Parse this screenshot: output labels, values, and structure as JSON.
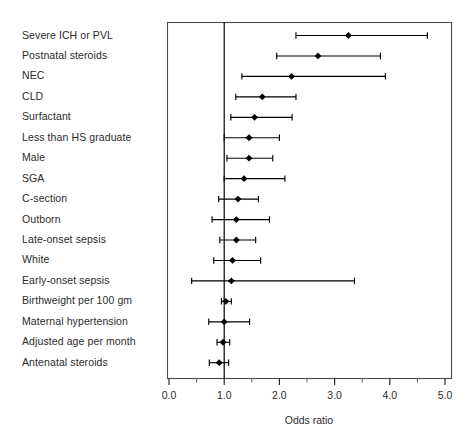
{
  "chart_data": {
    "type": "scatter",
    "plot_style": "forest-plot",
    "title": "",
    "xlabel": "Odds ratio",
    "ylabel": "",
    "xlim": [
      0.0,
      5.0
    ],
    "xticks": [
      0.0,
      1.0,
      2.0,
      3.0,
      4.0,
      5.0
    ],
    "xtick_labels": [
      "0.0",
      "1.0",
      "2.0",
      "3.0",
      "4.0",
      "5.0"
    ],
    "minor_xticks": [
      0.5,
      1.5,
      2.5,
      3.5,
      4.5
    ],
    "grid": false,
    "legend": null,
    "reference_line": 1.0,
    "marker": "filled-diamond",
    "categories": [
      "Severe ICH or PVL",
      "Postnatal steroids",
      "NEC",
      "CLD",
      "Surfactant",
      "Less than HS graduate",
      "Male",
      "SGA",
      "C-section",
      "Outborn",
      "Late-onset sepsis",
      "White",
      "Early-onset sepsis",
      "Birthweight per 100 gm",
      "Maternal hypertension",
      "Adjusted age per month",
      "Antenatal steroids"
    ],
    "values": [
      3.25,
      2.7,
      2.22,
      1.69,
      1.55,
      1.45,
      1.45,
      1.36,
      1.25,
      1.22,
      1.22,
      1.15,
      1.13,
      1.03,
      1.0,
      0.98,
      0.91
    ],
    "ci_low": [
      2.3,
      1.95,
      1.32,
      1.21,
      1.12,
      1.0,
      1.05,
      1.0,
      0.9,
      0.78,
      0.92,
      0.81,
      0.41,
      0.95,
      0.72,
      0.87,
      0.73
    ],
    "ci_high": [
      4.68,
      3.83,
      3.92,
      2.3,
      2.23,
      2.0,
      1.88,
      2.1,
      1.62,
      1.82,
      1.57,
      1.66,
      3.36,
      1.13,
      1.46,
      1.1,
      1.08
    ],
    "series": [
      {
        "name": "Adjusted odds ratio with 95% CI",
        "points": [
          {
            "label": "Severe ICH or PVL",
            "or": 3.25,
            "lo": 2.3,
            "hi": 4.68
          },
          {
            "label": "Postnatal steroids",
            "or": 2.7,
            "lo": 1.95,
            "hi": 3.83
          },
          {
            "label": "NEC",
            "or": 2.22,
            "lo": 1.32,
            "hi": 3.92
          },
          {
            "label": "CLD",
            "or": 1.69,
            "lo": 1.21,
            "hi": 2.3
          },
          {
            "label": "Surfactant",
            "or": 1.55,
            "lo": 1.12,
            "hi": 2.23
          },
          {
            "label": "Less than HS graduate",
            "or": 1.45,
            "lo": 1.0,
            "hi": 2.0
          },
          {
            "label": "Male",
            "or": 1.45,
            "lo": 1.05,
            "hi": 1.88
          },
          {
            "label": "SGA",
            "or": 1.36,
            "lo": 1.0,
            "hi": 2.1
          },
          {
            "label": "C-section",
            "or": 1.25,
            "lo": 0.9,
            "hi": 1.62
          },
          {
            "label": "Outborn",
            "or": 1.22,
            "lo": 0.78,
            "hi": 1.82
          },
          {
            "label": "Late-onset sepsis",
            "or": 1.22,
            "lo": 0.92,
            "hi": 1.57
          },
          {
            "label": "White",
            "or": 1.15,
            "lo": 0.81,
            "hi": 1.66
          },
          {
            "label": "Early-onset sepsis",
            "or": 1.13,
            "lo": 0.41,
            "hi": 3.36
          },
          {
            "label": "Birthweight per 100 gm",
            "or": 1.03,
            "lo": 0.95,
            "hi": 1.13
          },
          {
            "label": "Maternal hypertension",
            "or": 1.0,
            "lo": 0.72,
            "hi": 1.46
          },
          {
            "label": "Adjusted age per month",
            "or": 0.98,
            "lo": 0.87,
            "hi": 1.1
          },
          {
            "label": "Antenatal steroids",
            "or": 0.91,
            "lo": 0.73,
            "hi": 1.08
          }
        ]
      }
    ],
    "colors": {
      "marker": "#000000",
      "whisker": "#000000",
      "frame": "#4a4a4a",
      "reference_line": "#000000",
      "text": "#2b2b2b",
      "background": "#ffffff"
    }
  },
  "axis": {
    "xlabel": "Odds ratio"
  }
}
